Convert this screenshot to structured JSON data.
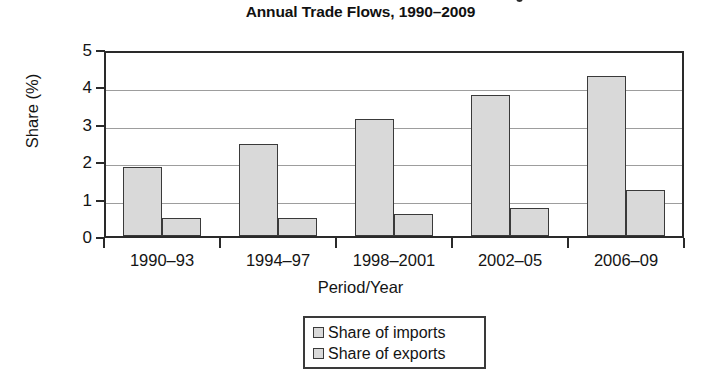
{
  "chart_data": {
    "type": "bar",
    "title": "Annual Trade Flows, 1990–2009",
    "title_clipped_above": true,
    "xlabel": "Period/Year",
    "ylabel": "Share (%)",
    "categories": [
      "1990–93",
      "1994–97",
      "1998–2001",
      "2002–05",
      "2006–09"
    ],
    "series": [
      {
        "name": "Share of imports",
        "values": [
          1.85,
          2.45,
          3.13,
          3.78,
          4.28
        ]
      },
      {
        "name": "Share of exports",
        "values": [
          0.48,
          0.48,
          0.58,
          0.76,
          1.22
        ]
      }
    ],
    "ylim": [
      0,
      5
    ],
    "yticks": [
      0,
      1,
      2,
      3,
      4,
      5
    ],
    "ytick_labels": [
      "0",
      "1",
      "2",
      "3",
      "4",
      "5"
    ],
    "grid": true,
    "legend_position": "bottom-center",
    "colors": {
      "bar_fill": "#d9d9d9",
      "bar_edge": "#3a3a3a",
      "axis": "#2a2a2a",
      "gridline": "#9d9d9d",
      "text": "#141414",
      "background": "#ffffff"
    }
  },
  "legend": {
    "items": [
      {
        "label": "Share of imports",
        "swatch": "#d9d9d9"
      },
      {
        "label": "Share of exports",
        "swatch": "#d9d9d9"
      }
    ]
  }
}
